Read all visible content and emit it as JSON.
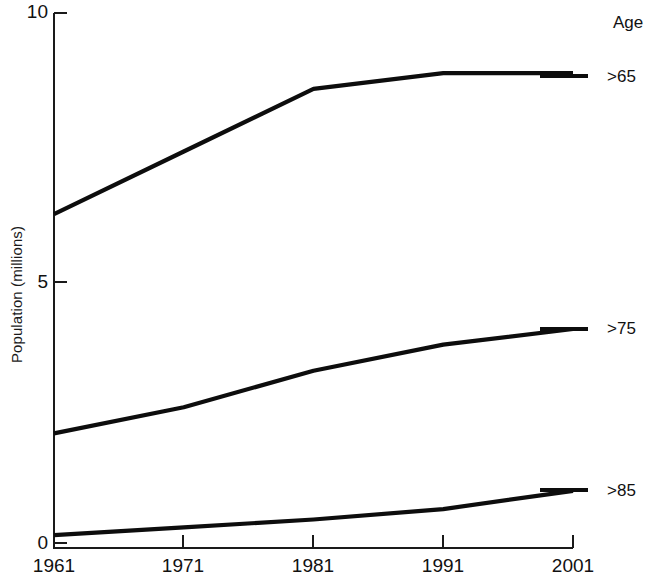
{
  "chart_data": {
    "type": "line",
    "title": "",
    "xlabel": "",
    "ylabel": "Population (millions)",
    "x": [
      1961,
      1971,
      1981,
      1991,
      2001
    ],
    "xticklabels": [
      "1961",
      "1971",
      "1981",
      "1991",
      "2001"
    ],
    "yticks": [
      0,
      5,
      10
    ],
    "yticklabels": [
      "0",
      "5",
      "10"
    ],
    "ylim": [
      0,
      10
    ],
    "xlim": [
      1961,
      2001
    ],
    "grid": false,
    "legend_position": "right",
    "legend_title": "Age",
    "series": [
      {
        "name": ">65",
        "values": [
          6.3,
          7.5,
          8.7,
          9.0,
          9.0
        ]
      },
      {
        "name": ">75",
        "values": [
          2.1,
          2.6,
          3.3,
          3.8,
          4.1
        ]
      },
      {
        "name": ">85",
        "values": [
          0.15,
          0.3,
          0.45,
          0.65,
          1.0
        ]
      }
    ]
  },
  "axes": {
    "y_title": "Population (millions)",
    "y_tick_0": "0",
    "y_tick_5": "5",
    "y_tick_10": "10",
    "x_tick_1961": "1961",
    "x_tick_1971": "1971",
    "x_tick_1981": "1981",
    "x_tick_1991": "1991",
    "x_tick_2001": "2001"
  },
  "legend": {
    "title": "Age",
    "items": [
      {
        "label": ">65"
      },
      {
        "label": ">75"
      },
      {
        "label": ">85"
      }
    ]
  },
  "colors": {
    "line": "#0d0d0d",
    "axis": "#1a1a1a",
    "background": "#ffffff",
    "text": "#111111"
  }
}
